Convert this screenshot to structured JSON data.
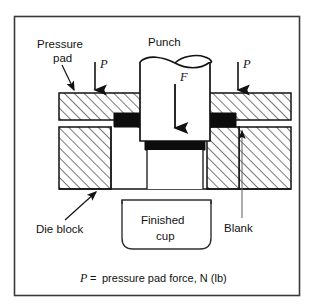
{
  "figure": {
    "title_visible": false,
    "frame": {
      "stroke": "#3a3a3a"
    },
    "labels": {
      "pressure_pad_line1": "Pressure",
      "pressure_pad_line2": "pad",
      "punch": "Punch",
      "force_f": "F",
      "pressure_left": "P",
      "pressure_right": "P",
      "die_block": "Die block",
      "blank": "Blank",
      "finished_cup_line1": "Finished",
      "finished_cup_line2": "cup"
    },
    "caption": {
      "symbol": "P",
      "equals": "=",
      "text": "pressure pad force, N (lb)"
    },
    "colors": {
      "line": "#121212",
      "blank_fill": "#0d0d0d",
      "hatch": "#2a2a2a",
      "background": "#ffffff",
      "frame": "#3a3a3a"
    },
    "parts": [
      {
        "name": "punch",
        "kind": "cylinder",
        "fill": "white"
      },
      {
        "name": "pressure-pad-left",
        "kind": "hatched-block"
      },
      {
        "name": "pressure-pad-right",
        "kind": "hatched-block"
      },
      {
        "name": "die-block-left",
        "kind": "hatched-block"
      },
      {
        "name": "die-block-right",
        "kind": "hatched-block"
      },
      {
        "name": "blank",
        "kind": "solid-sheet",
        "fill": "#0d0d0d"
      },
      {
        "name": "finished-cup",
        "kind": "rounded-outline"
      }
    ]
  }
}
